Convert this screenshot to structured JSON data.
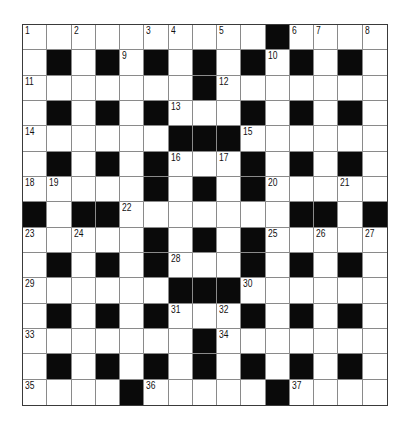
{
  "puzzle": {
    "rows": 15,
    "cols": 15,
    "colors": {
      "block": "#0a0a0a",
      "cell": "#ffffff",
      "grid_line": "#8a8a8a",
      "border": "#3a3a3a"
    },
    "layout": [
      ".... .....#....",
      ".#.#.#.#.#.#.#.",
      ".......#.......",
      ".#.#.#...#.#.#.",
      "......###......",
      ".#.#.#...#.#.#.",
      ".....#.#.#.....",
      "#.##.......##.#",
      ".....#.#.#.....",
      ".#.#.#...#.#.#.",
      "......###......",
      ".#.#.#...#.#.#.",
      ".......#.......",
      ".#.#.#.#.#.#.#.",
      "....#.....#...."
    ],
    "numbers": [
      {
        "r": 0,
        "c": 0,
        "n": "1"
      },
      {
        "r": 0,
        "c": 2,
        "n": "2"
      },
      {
        "r": 0,
        "c": 5,
        "n": "3"
      },
      {
        "r": 0,
        "c": 6,
        "n": "4"
      },
      {
        "r": 0,
        "c": 8,
        "n": "5"
      },
      {
        "r": 0,
        "c": 11,
        "n": "6"
      },
      {
        "r": 0,
        "c": 12,
        "n": "7"
      },
      {
        "r": 0,
        "c": 14,
        "n": "8"
      },
      {
        "r": 1,
        "c": 4,
        "n": "9"
      },
      {
        "r": 1,
        "c": 10,
        "n": "10"
      },
      {
        "r": 2,
        "c": 0,
        "n": "11"
      },
      {
        "r": 2,
        "c": 8,
        "n": "12"
      },
      {
        "r": 3,
        "c": 6,
        "n": "13"
      },
      {
        "r": 4,
        "c": 0,
        "n": "14"
      },
      {
        "r": 4,
        "c": 9,
        "n": "15"
      },
      {
        "r": 5,
        "c": 6,
        "n": "16"
      },
      {
        "r": 5,
        "c": 8,
        "n": "17"
      },
      {
        "r": 6,
        "c": 0,
        "n": "18"
      },
      {
        "r": 6,
        "c": 1,
        "n": "19"
      },
      {
        "r": 6,
        "c": 10,
        "n": "20"
      },
      {
        "r": 6,
        "c": 13,
        "n": "21"
      },
      {
        "r": 7,
        "c": 4,
        "n": "22"
      },
      {
        "r": 8,
        "c": 0,
        "n": "23"
      },
      {
        "r": 8,
        "c": 2,
        "n": "24"
      },
      {
        "r": 8,
        "c": 10,
        "n": "25"
      },
      {
        "r": 8,
        "c": 12,
        "n": "26"
      },
      {
        "r": 8,
        "c": 14,
        "n": "27"
      },
      {
        "r": 9,
        "c": 6,
        "n": "28"
      },
      {
        "r": 10,
        "c": 0,
        "n": "29"
      },
      {
        "r": 10,
        "c": 9,
        "n": "30"
      },
      {
        "r": 11,
        "c": 6,
        "n": "31"
      },
      {
        "r": 11,
        "c": 8,
        "n": "32"
      },
      {
        "r": 12,
        "c": 0,
        "n": "33"
      },
      {
        "r": 12,
        "c": 8,
        "n": "34"
      },
      {
        "r": 13,
        "c": 4,
        "n": "35_placeholder_unused"
      },
      {
        "r": 14,
        "c": 0,
        "n": "35"
      },
      {
        "r": 14,
        "c": 5,
        "n": "36"
      },
      {
        "r": 14,
        "c": 11,
        "n": "37"
      }
    ]
  }
}
